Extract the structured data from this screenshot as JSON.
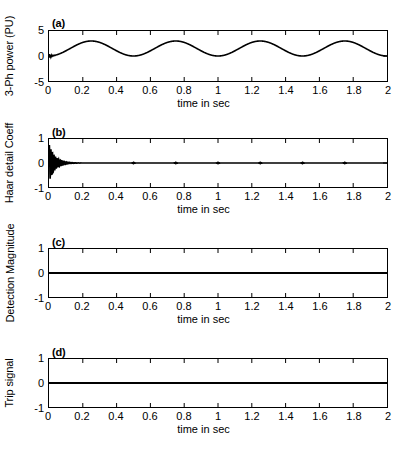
{
  "figure": {
    "background": "#ffffff",
    "line_color": "#000000",
    "axis_color": "#000000"
  },
  "common": {
    "xlabel": "time in sec",
    "xticks": [
      "0",
      "0.2",
      "0.4",
      "0.6",
      "0.8",
      "1",
      "1.2",
      "1.4",
      "1.6",
      "1.8",
      "2"
    ],
    "xtick_values": [
      0,
      0.2,
      0.4,
      0.6,
      0.8,
      1,
      1.2,
      1.4,
      1.6,
      1.8,
      2
    ],
    "xlim": [
      0,
      2
    ]
  },
  "panels": [
    {
      "tag": "(a)",
      "ylabel": "3-Ph power (PU)",
      "yticks": [
        "5",
        "0",
        "-5"
      ],
      "ytick_values": [
        5,
        0,
        -5
      ],
      "ylim": [
        -5,
        5
      ]
    },
    {
      "tag": "(b)",
      "ylabel": "Haar detail Coeff",
      "yticks": [
        "1",
        "0",
        "-1"
      ],
      "ytick_values": [
        1,
        0,
        -1
      ],
      "ylim": [
        -1,
        1
      ]
    },
    {
      "tag": "(c)",
      "ylabel": "Detection Magnitude",
      "yticks": [
        "1",
        "0",
        "-1"
      ],
      "ytick_values": [
        1,
        0,
        -1
      ],
      "ylim": [
        -1,
        1
      ]
    },
    {
      "tag": "(d)",
      "ylabel": "Trip signal",
      "yticks": [
        "1",
        "0",
        "-1"
      ],
      "ytick_values": [
        1,
        0,
        -1
      ],
      "ylim": [
        -1,
        1
      ]
    }
  ],
  "chart_data": [
    {
      "type": "line",
      "title": "(a)",
      "xlabel": "time in sec",
      "ylabel": "3-Ph power (PU)",
      "xlim": [
        0,
        2
      ],
      "ylim": [
        -5,
        5
      ],
      "grid": false,
      "legend": null,
      "description": "Three-phase power in per-unit. Starts at 0 with a brief high-frequency start-up transient near t=0, then settles into a steady sinusoidal oscillation of period 0.5 s riding between 0 and about 3 PU (mean 1.5, amplitude 1.5). Peaks occur at t = 0.25, 0.75, 1.25, 1.75 s; troughs at t = 0.5, 1.0, 1.5, 2.0 s.",
      "model": {
        "form": "mean + amplitude * -cos(2*pi*t/period)",
        "mean": 1.5,
        "amplitude": 1.5,
        "period": 0.5,
        "transient_end": 0.05,
        "transient_amplitude": 0.45
      },
      "series": [
        {
          "name": "3-Ph power",
          "x": [
            0,
            0.05,
            0.1,
            0.15,
            0.2,
            0.25,
            0.3,
            0.35,
            0.4,
            0.45,
            0.5,
            0.55,
            0.6,
            0.65,
            0.7,
            0.75,
            0.8,
            0.85,
            0.9,
            0.95,
            1.0,
            1.05,
            1.1,
            1.15,
            1.2,
            1.25,
            1.3,
            1.35,
            1.4,
            1.45,
            1.5,
            1.55,
            1.6,
            1.65,
            1.7,
            1.75,
            1.8,
            1.85,
            1.9,
            1.95,
            2.0
          ],
          "values": [
            0,
            0.15,
            0.59,
            1.28,
            2.07,
            2.78,
            3.0,
            2.78,
            2.21,
            1.5,
            0.0,
            0.22,
            0.79,
            1.5,
            2.21,
            3.0,
            2.78,
            2.21,
            1.5,
            0.79,
            0.0,
            0.22,
            0.79,
            1.5,
            2.21,
            3.0,
            2.78,
            2.21,
            1.5,
            0.79,
            0.0,
            0.22,
            0.79,
            1.5,
            2.21,
            3.0,
            2.78,
            2.21,
            1.5,
            0.79,
            0.0
          ]
        }
      ]
    },
    {
      "type": "line",
      "title": "(b)",
      "xlabel": "time in sec",
      "ylabel": "Haar detail Coeff",
      "xlim": [
        0,
        2
      ],
      "ylim": [
        -1,
        1
      ],
      "grid": false,
      "legend": null,
      "description": "Haar wavelet detail coefficients of the power signal. A large damped high-frequency burst occurs at start-up from t=0 to about t=0.2 s, peaking near +0.75 and -0.8, decaying exponentially to essentially zero. After t≈0.2 s the coefficients stay flat at 0 with only tiny residual ripples at the sinusoid trough instants (0.5, 0.75, 1.0, 1.25, 1.5, 1.75 s).",
      "model": {
        "form": "A * exp(-t/tau) * sin(2*pi*f*t)",
        "initial_amplitude": 0.8,
        "decay_tau": 0.035,
        "ring_frequency_hz": 110,
        "burst_end": 0.2,
        "residual_ripple": 0.03
      },
      "series": [
        {
          "name": "Haar detail Coeff",
          "x": [
            0,
            0.01,
            0.02,
            0.03,
            0.04,
            0.05,
            0.07,
            0.09,
            0.11,
            0.13,
            0.15,
            0.2,
            0.4,
            0.8,
            1.2,
            1.6,
            2.0
          ],
          "values": [
            0,
            -0.8,
            0.75,
            -0.5,
            0.38,
            -0.3,
            0.2,
            -0.14,
            0.09,
            -0.06,
            0.04,
            0.01,
            0.0,
            0.0,
            0.0,
            0.0,
            0.0
          ]
        }
      ]
    },
    {
      "type": "line",
      "title": "(c)",
      "xlabel": "time in sec",
      "ylabel": "Detection Magnitude",
      "xlim": [
        0,
        2
      ],
      "ylim": [
        -1,
        1
      ],
      "grid": false,
      "legend": null,
      "description": "Detection magnitude stays flat at zero over the entire 0 to 2 s window — no fault detected.",
      "series": [
        {
          "name": "Detection Magnitude",
          "x": [
            0,
            2
          ],
          "values": [
            0,
            0
          ]
        }
      ]
    },
    {
      "type": "line",
      "title": "(d)",
      "xlabel": "time in sec",
      "ylabel": "Trip signal",
      "xlim": [
        0,
        2
      ],
      "ylim": [
        -1,
        1
      ],
      "grid": false,
      "legend": null,
      "description": "Trip signal remains flat at zero (de-asserted) for the whole 0 to 2 s window — the relay never trips.",
      "series": [
        {
          "name": "Trip signal",
          "x": [
            0,
            2
          ],
          "values": [
            0,
            0
          ]
        }
      ]
    }
  ]
}
